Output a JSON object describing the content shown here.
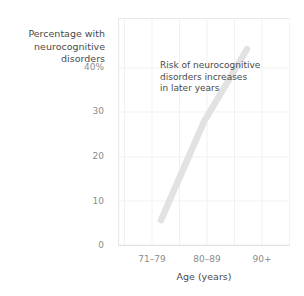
{
  "chart_data": {
    "type": "line",
    "title": "",
    "subtitle": "",
    "categories": [
      "71–79",
      "80–89",
      "90+"
    ],
    "values": [
      5,
      24,
      38
    ],
    "series": [
      {
        "name": "Percentage with neurocognitive disorders",
        "values": [
          5,
          24,
          38
        ]
      }
    ],
    "xlabel": "Age (years)",
    "ylabel": "Percentage with\nneurocognitive\ndisorders",
    "ylabel_lines": [
      "Percentage with",
      "neurocognitive",
      "disorders"
    ],
    "yticks": [
      "40%",
      "30",
      "20",
      "10",
      "0"
    ],
    "ytick_values": [
      40,
      30,
      20,
      10,
      0
    ],
    "ylim": [
      0,
      44
    ],
    "xlim": [
      0,
      3
    ],
    "grid": true,
    "legend": "none",
    "annotations": [
      {
        "text": "Risk of neurocognitive\ndisorders increases\nin later years",
        "lines": [
          "Risk of neurocognitive",
          "disorders increases",
          "in later years"
        ],
        "x": "80–89",
        "y": 38
      }
    ],
    "colors": {
      "line": "#e2e2e2",
      "grid": "#f0f0f0",
      "axis": "#e6e6e6",
      "tick_text": "#8c8c8c",
      "label_text": "#4a4a4a",
      "background": "#ffffff"
    }
  },
  "axis": {
    "y_label": "Percentage with\nneurocognitive\ndisorders",
    "x_label": "Age (years)",
    "y_ticks": [
      {
        "label": "40%"
      },
      {
        "label": "30"
      },
      {
        "label": "20"
      },
      {
        "label": "10"
      },
      {
        "label": "0"
      }
    ],
    "x_ticks": [
      {
        "label": "71–79"
      },
      {
        "label": "80–89"
      },
      {
        "label": "90+"
      }
    ]
  },
  "annotation": {
    "text": "Risk of neurocognitive\ndisorders increases\nin later years"
  }
}
